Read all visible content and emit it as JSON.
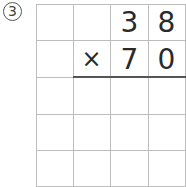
{
  "problem": {
    "number_label": "3",
    "rows": [
      [
        "",
        "",
        "3",
        "8"
      ],
      [
        "",
        "×",
        "7",
        "0"
      ],
      [
        "",
        "",
        "",
        ""
      ],
      [
        "",
        "",
        "",
        ""
      ],
      [
        "",
        "",
        "",
        ""
      ]
    ],
    "operator": "×",
    "multiplicand": "38",
    "multiplier": "70"
  },
  "colors": {
    "grid_line": "#bdbdbd",
    "result_line": "#555555",
    "digit": "#2a2a2a"
  }
}
